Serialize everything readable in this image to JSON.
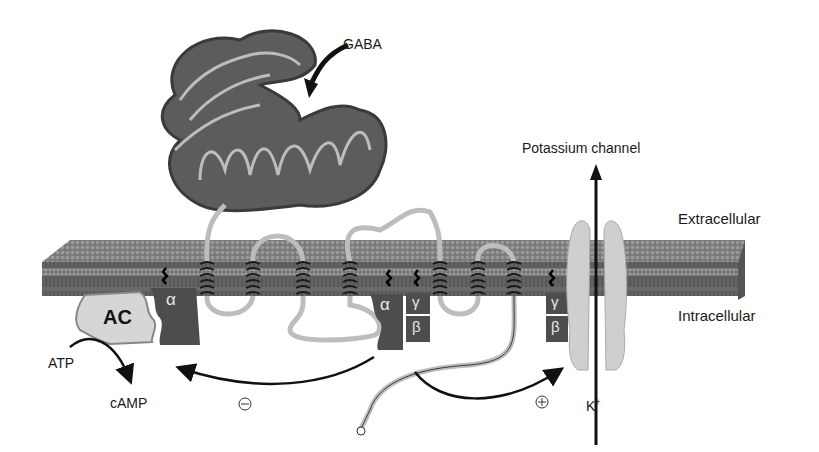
{
  "diagram": {
    "labels": {
      "ligand": "GABA",
      "channel": "Potassium channel",
      "extracellular": "Extracellular",
      "intracellular": "Intracellular",
      "ion": "K",
      "ion_charge": "+",
      "enzyme": "AC",
      "substrate": "ATP",
      "product": "cAMP",
      "inhibit_sign": "−",
      "activate_sign": "+"
    },
    "subunits": {
      "alpha_left": "α",
      "alpha_center": "α",
      "gamma_center": "γ",
      "beta_center": "β",
      "gamma_right": "γ",
      "beta_right": "β"
    },
    "colors": {
      "membrane": "#6e6e6e",
      "membrane_top": "#8a8a8a",
      "receptor_domain": "#5c5c5c",
      "receptor_strand": "#bdbdbd",
      "g_protein": "#4d4d4d",
      "adenylyl_cyclase": "#d6d6d6",
      "channel": "#c8c8c8",
      "arrow": "#111111"
    },
    "transmembrane_helix_count": 7
  }
}
